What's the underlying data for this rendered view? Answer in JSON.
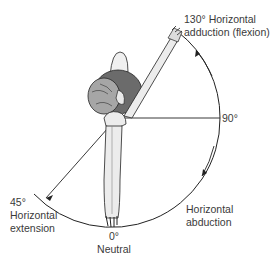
{
  "diagram": {
    "labels": {
      "flexion": {
        "line1": "130° Horizontal",
        "line2": "adduction (flexion)"
      },
      "ninety": "90°",
      "abduction": {
        "line1": "Horizontal",
        "line2": "abduction"
      },
      "extension": {
        "line1": "45°",
        "line2": "Horizontal",
        "line3": "extension"
      },
      "neutral": {
        "line1": "0°",
        "line2": "Neutral"
      }
    },
    "angles_deg": {
      "neutral": 0,
      "right_horizontal": 90,
      "horizontal_adduction": 130,
      "horizontal_extension": 45
    },
    "colors": {
      "line": "#222222",
      "skin": "#e8e8e8",
      "shirt": "#6b6b6b",
      "hair": "#9a9a9a",
      "text": "#3a3a3a"
    }
  }
}
